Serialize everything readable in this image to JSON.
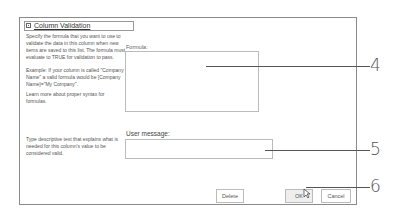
{
  "panel": {
    "title": "Column Validation",
    "icon": "collapse-icon",
    "description_formula": "Specify the formula that you want to use to validate the data in this column when new items are saved to this list. The formula must evaluate to TRUE for validation to pass.",
    "example": "Example: If your column is called \"Company Name\" a valid formula would be [Company Name]=\"My Company\".",
    "learn_more": "Learn more about proper syntax for formulas.",
    "description_message": "Type descriptive text that explains what is needed for this column's value to be considered valid."
  },
  "formula": {
    "label": "Formula:",
    "value": ""
  },
  "user_message": {
    "label": "User message:",
    "value": ""
  },
  "buttons": {
    "delete": "Delete",
    "ok": "OK",
    "cancel": "Cancel"
  },
  "callouts": [
    "4",
    "5",
    "6"
  ]
}
